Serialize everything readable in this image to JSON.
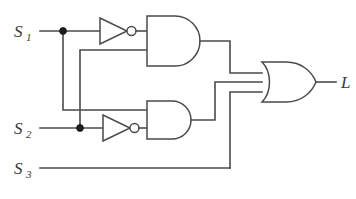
{
  "diagram": {
    "type": "digital-logic-schematic"
  },
  "colors": {
    "wire": "#4a4a4a",
    "gate_outline": "#4a4a4a",
    "gate_fill": "#ffffff",
    "junction": "#1c1c1c",
    "label": "#3a3a3a",
    "background": "#ffffff"
  },
  "inputs": [
    {
      "id": "s1",
      "base": "S",
      "subscript": "1",
      "label": "S1",
      "y": 31
    },
    {
      "id": "s2",
      "base": "S",
      "subscript": "2",
      "label": "S2",
      "y": 128
    },
    {
      "id": "s3",
      "base": "S",
      "subscript": "3",
      "label": "S3",
      "y": 168
    }
  ],
  "output": {
    "id": "l",
    "base": "L",
    "subscript": "",
    "label": "L",
    "y": 82
  },
  "gates": [
    {
      "id": "not1",
      "type": "NOT",
      "label": "inverter-1",
      "inputs": [
        "S1"
      ],
      "output": "notS1"
    },
    {
      "id": "not2",
      "type": "NOT",
      "label": "inverter-2",
      "inputs": [
        "S2"
      ],
      "output": "notS2"
    },
    {
      "id": "and1",
      "type": "AND",
      "label": "and-gate-top",
      "inputs": [
        "notS1",
        "S2"
      ],
      "output": "A"
    },
    {
      "id": "and2",
      "type": "AND",
      "label": "and-gate-bottom",
      "inputs": [
        "S1",
        "notS2"
      ],
      "output": "B"
    },
    {
      "id": "or1",
      "type": "OR",
      "label": "or-gate",
      "inputs": [
        "A",
        "B",
        "S3"
      ],
      "output": "L"
    }
  ],
  "junctions": [
    {
      "id": "j1",
      "on": "S1",
      "x": 63,
      "y": 31
    },
    {
      "id": "j2",
      "on": "S2",
      "x": 80,
      "y": 128
    }
  ]
}
